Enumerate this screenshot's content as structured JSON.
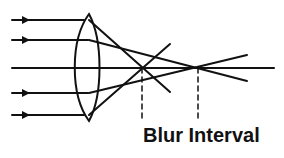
{
  "diagram": {
    "label": "Blur Interval",
    "colors": {
      "stroke": "#111111",
      "background": "#ffffff"
    },
    "lens": {
      "type": "biconvex",
      "center_x": 89,
      "top_y": 14,
      "bottom_y": 121
    },
    "optical_axis_y": 68,
    "incoming_rays_y": [
      30,
      50,
      68,
      93,
      115
    ],
    "focal_points": [
      {
        "name": "marginal-focus",
        "x": 140,
        "y": 68
      },
      {
        "name": "paraxial-focus",
        "x": 200,
        "y": 68
      }
    ]
  }
}
